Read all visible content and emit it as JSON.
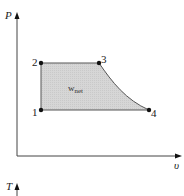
{
  "diagram": {
    "type": "P-v diagram",
    "axes": {
      "y_label": "P",
      "x_label": "υ",
      "second_plot_y_label": "T"
    },
    "points": [
      {
        "id": "1",
        "label": "1"
      },
      {
        "id": "2",
        "label": "2"
      },
      {
        "id": "3",
        "label": "3"
      },
      {
        "id": "4",
        "label": "4"
      }
    ],
    "area_label": {
      "main": "w",
      "subscript": "net"
    },
    "colors": {
      "fill": "#d4d4d4",
      "line": "#555555",
      "axis": "#444444",
      "point": "#111111"
    }
  }
}
